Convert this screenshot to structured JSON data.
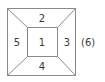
{
  "diagram": {
    "type": "cube-net-frustum",
    "faces": {
      "center": "1",
      "top": "2",
      "right": "3",
      "bottom": "4",
      "left": "5",
      "hidden": "(6)"
    },
    "colors": {
      "line": "#8a8a8a",
      "text": "#3a3a3a"
    }
  }
}
